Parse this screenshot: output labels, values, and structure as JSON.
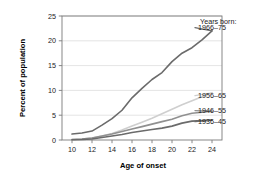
{
  "chart_data": {
    "type": "line",
    "title": "",
    "xlabel": "Age of onset",
    "ylabel": "Percent of population",
    "xlim": [
      9,
      25
    ],
    "ylim": [
      0,
      25
    ],
    "xticks": [
      10,
      12,
      14,
      16,
      18,
      20,
      22,
      24
    ],
    "yticks": [
      0,
      5,
      10,
      15,
      20,
      25
    ],
    "xtick_labels": [
      "10",
      "12",
      "14",
      "16",
      "18",
      "20",
      "22",
      "24"
    ],
    "ytick_labels": [
      "0",
      "5",
      "10",
      "15",
      "20",
      "25"
    ],
    "grid": "horizontal",
    "legend_position": "inline-right",
    "legend_heading": "Years born:",
    "x": [
      10,
      11,
      12,
      13,
      14,
      15,
      16,
      17,
      18,
      19,
      20,
      21,
      22,
      23,
      24
    ],
    "series": [
      {
        "name": "1966–75",
        "label": "1966–75",
        "color": "#6b6b6b",
        "width": 1.6,
        "values": [
          1.2,
          1.4,
          1.8,
          3.0,
          4.3,
          6.0,
          8.5,
          10.4,
          12.2,
          13.6,
          15.8,
          17.5,
          18.6,
          20.2,
          22.0
        ],
        "label_x": 24,
        "label_y": 22.0
      },
      {
        "name": "1956–65",
        "label": "1956–65",
        "color": "#cfcfcf",
        "width": 1.6,
        "values": [
          0.1,
          0.2,
          0.4,
          0.8,
          1.3,
          2.0,
          2.8,
          3.6,
          4.4,
          5.3,
          6.2,
          7.1,
          7.9,
          8.7,
          9.5
        ],
        "label_x": 24,
        "label_y": 9.5
      },
      {
        "name": "1946–55",
        "label": "1946–55",
        "color": "#909090",
        "width": 1.6,
        "values": [
          0.1,
          0.2,
          0.4,
          0.8,
          1.2,
          1.7,
          2.2,
          2.7,
          3.2,
          3.7,
          4.2,
          4.9,
          5.4,
          5.6,
          5.8
        ],
        "label_x": 24,
        "label_y": 5.8
      },
      {
        "name": "1936–45",
        "label": "1936–45",
        "color": "#6b6b6b",
        "width": 1.6,
        "values": [
          0.05,
          0.1,
          0.2,
          0.5,
          0.8,
          1.1,
          1.5,
          1.8,
          2.1,
          2.4,
          2.8,
          3.4,
          3.8,
          3.9,
          4.0
        ],
        "label_x": 24,
        "label_y": 4.0
      }
    ]
  },
  "axes": {
    "xlabel": "Age of onset",
    "ylabel": "Percent of population"
  },
  "legend": {
    "heading": "Years born:",
    "entries": [
      "1966–75",
      "1956–65",
      "1946–55",
      "1936–45"
    ]
  },
  "style": {
    "background": "#ffffff",
    "frame_color": "#7a7a7a",
    "grid_color": "#dddddd",
    "text_color": "#1a1a1a"
  }
}
